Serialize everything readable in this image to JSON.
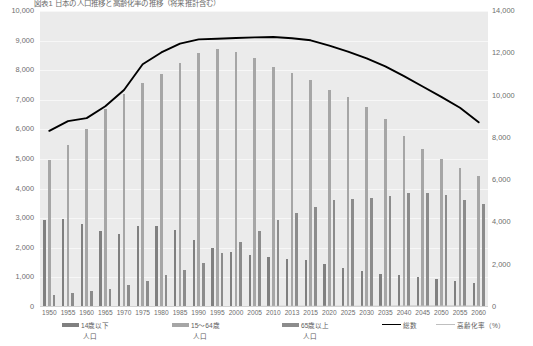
{
  "chart": {
    "title": "図表1 日本の人口推移と高齢化率の推移（将来推計含む）"
  },
  "legend": {
    "position": "bottom",
    "items": [
      {
        "name": "14歳以下",
        "sub": "人口",
        "color": "#808080",
        "marker": "bar"
      },
      {
        "name": "15～64歳",
        "sub": "人口",
        "color": "#a6a6a6",
        "marker": "bar"
      },
      {
        "name": "65歳以上",
        "sub": "人口",
        "color": "#8c8c8c",
        "marker": "bar"
      },
      {
        "name": "総数",
        "sub": "",
        "color": "#000000",
        "marker": "line"
      },
      {
        "name": "高齢化率（%）",
        "sub": "",
        "color": "#bfbfbf",
        "marker": "line"
      }
    ]
  },
  "chart_data": {
    "type": "bar",
    "title": "図表1 日本の人口推移と高齢化率の推移（将来推計含む）",
    "xlabel": "",
    "ylabel": "",
    "grid": true,
    "categories": [
      "1950",
      "1955",
      "1960",
      "1965",
      "1970",
      "1975",
      "1980",
      "1985",
      "1990",
      "1995",
      "2000",
      "2005",
      "2010",
      "2013",
      "2015",
      "2020",
      "2025",
      "2030",
      "2035",
      "2040",
      "2045",
      "2050",
      "2055",
      "2060"
    ],
    "y_left": {
      "label": "",
      "ticks": [
        "0",
        "1,000",
        "2,000",
        "3,000",
        "4,000",
        "5,000",
        "6,000",
        "7,000",
        "8,000",
        "9,000",
        "10,000"
      ],
      "ylim": [
        0,
        10000
      ]
    },
    "y_right": {
      "label": "",
      "ticks": [
        "0",
        "2,000",
        "4,000",
        "6,000",
        "8,000",
        "10,000",
        "12,000",
        "14,000"
      ],
      "ylim": [
        0,
        14000
      ]
    },
    "series": [
      {
        "name": "14歳以下人口",
        "axis": "left",
        "type": "bar",
        "color": "#808080",
        "values": [
          2943,
          2980,
          2807,
          2553,
          2482,
          2722,
          2751,
          2603,
          2249,
          2001,
          1851,
          1752,
          1684,
          1639,
          1583,
          1457,
          1324,
          1204,
          1129,
          1073,
          1012,
          939,
          872,
          821
        ]
      },
      {
        "name": "15～64歳人口",
        "axis": "left",
        "type": "bar",
        "color": "#a6a6a6",
        "values": [
          4966,
          5473,
          6000,
          6693,
          7212,
          7581,
          7883,
          8251,
          8590,
          8716,
          8622,
          8409,
          8103,
          7901,
          7682,
          7341,
          7085,
          6773,
          6343,
          5787,
          5353,
          5001,
          4706,
          4418
        ]
      },
      {
        "name": "65歳以上人口",
        "axis": "left",
        "type": "bar",
        "color": "#8c8c8c",
        "values": [
          411,
          475,
          535,
          618,
          733,
          887,
          1065,
          1247,
          1489,
          1826,
          2201,
          2567,
          2925,
          3190,
          3387,
          3612,
          3657,
          3685,
          3741,
          3868,
          3856,
          3768,
          3626,
          3464
        ]
      },
      {
        "name": "総数",
        "axis": "left",
        "type": "line",
        "color": "#000000",
        "values": [
          5950,
          6280,
          6380,
          6780,
          7330,
          8200,
          8600,
          8900,
          9040,
          9060,
          9090,
          9110,
          9120,
          9080,
          9010,
          8830,
          8630,
          8400,
          8130,
          7800,
          7450,
          7100,
          6730,
          6240
        ]
      },
      {
        "name": "高齢化率（%）",
        "axis": "right",
        "type": "line",
        "color": "#bfbfbf",
        "values": [
          4.9,
          5.3,
          5.7,
          6.3,
          7.1,
          7.9,
          9.1,
          10.3,
          12.1,
          14.6,
          17.4,
          20.2,
          23.0,
          25.1,
          26.6,
          28.9,
          30.3,
          31.6,
          33.4,
          36.1,
          36.8,
          37.7,
          38.0,
          39.9
        ]
      }
    ]
  }
}
